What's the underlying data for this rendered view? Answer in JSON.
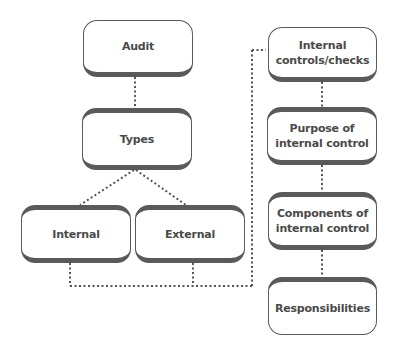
{
  "diagram": {
    "nodes": {
      "audit": {
        "label": "Audit"
      },
      "types": {
        "label": "Types"
      },
      "internal": {
        "label": "Internal"
      },
      "external": {
        "label": "External"
      },
      "internal_controls": {
        "label": "Internal\ncontrols/checks"
      },
      "purpose": {
        "label": "Purpose of\ninternal control"
      },
      "components": {
        "label": "Components of\ninternal control"
      },
      "responsibilities": {
        "label": "Responsibilities"
      }
    },
    "edges": [
      {
        "from": "audit",
        "to": "types",
        "style": "dotted"
      },
      {
        "from": "types",
        "to": "internal",
        "style": "dotted"
      },
      {
        "from": "types",
        "to": "external",
        "style": "dotted"
      },
      {
        "from": "internal",
        "to": "internal_controls",
        "style": "dotted"
      },
      {
        "from": "external",
        "to": "internal_controls",
        "style": "dotted"
      },
      {
        "from": "internal_controls",
        "to": "purpose",
        "style": "dotted"
      },
      {
        "from": "purpose",
        "to": "components",
        "style": "dotted"
      },
      {
        "from": "components",
        "to": "responsibilities",
        "style": "dotted"
      }
    ],
    "colors": {
      "border": "#5a5a5a",
      "text": "#4a4a4a",
      "connector": "#555555",
      "background": "#ffffff"
    }
  }
}
